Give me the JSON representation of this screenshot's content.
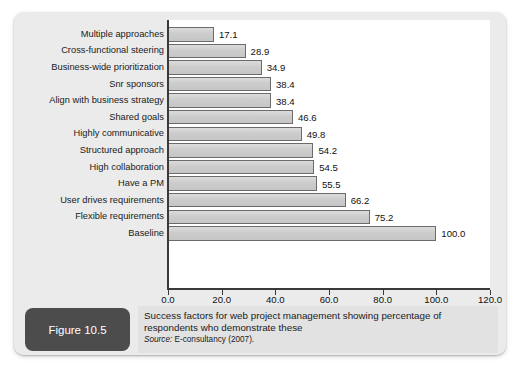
{
  "figure": {
    "badge_label": "Figure 10.5",
    "caption": "Success factors for web project management showing percentage of respondents who demonstrate these",
    "source_prefix": "Source:",
    "source_body": " E-consultancy (2007)."
  },
  "colors": {
    "panel_bg": "#ebebeb",
    "plot_bg": "#ffffff",
    "bar_fill": "#cfcfcf",
    "bar_stroke": "#6b6b6b",
    "axis": "#3a3a3a",
    "badge_bg": "#4c4c4c",
    "caption_bg": "#e2e2e2",
    "text": "#111111"
  },
  "chart_data": {
    "type": "bar",
    "orientation": "horizontal",
    "title": "",
    "xlabel": "",
    "ylabel": "",
    "xlim": [
      0,
      120
    ],
    "grid": false,
    "legend": null,
    "xticks": [
      "0.0",
      "20.0",
      "40.0",
      "60.0",
      "80.0",
      "100.0",
      "120.0"
    ],
    "xtick_values": [
      0,
      20,
      40,
      60,
      80,
      100,
      120
    ],
    "categories": [
      "Multiple approaches",
      "Cross-functional steering",
      "Business-wide prioritization",
      "Snr sponsors",
      "Align with business strategy",
      "Shared goals",
      "Highly communicative",
      "Structured approach",
      "High collaboration",
      "Have a PM",
      "User drives requirements",
      "Flexible requirements",
      "Baseline"
    ],
    "values": [
      17.1,
      28.9,
      34.9,
      38.4,
      38.4,
      46.6,
      49.8,
      54.2,
      54.5,
      55.5,
      66.2,
      75.2,
      100.0
    ],
    "value_labels": [
      "17.1",
      "28.9",
      "34.9",
      "38.4",
      "38.4",
      "46.6",
      "49.8",
      "54.2",
      "54.5",
      "55.5",
      "66.2",
      "75.2",
      "100.0"
    ]
  }
}
